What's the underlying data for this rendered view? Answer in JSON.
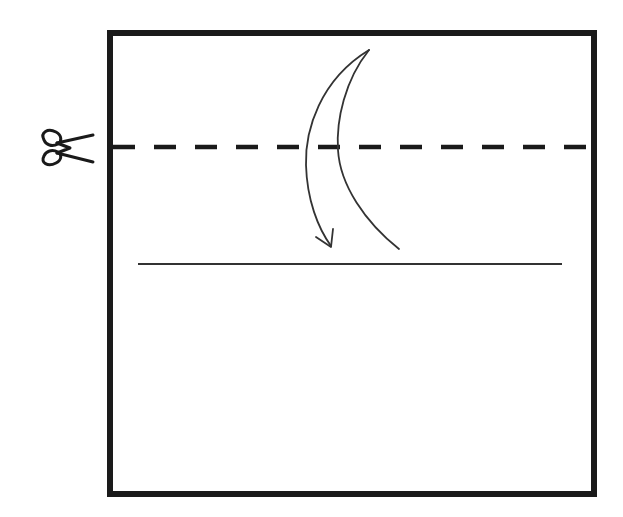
{
  "diagram": {
    "type": "origami-fold-instruction",
    "colors": {
      "background": "#ffffff",
      "stroke": "#1a1a1a",
      "thin_stroke": "#333333"
    },
    "paper": {
      "shape": "square",
      "x": 107,
      "y": 30,
      "width": 490,
      "height": 467,
      "border_width": 6
    },
    "cut_line": {
      "style": "dashed",
      "y": 147,
      "x_start": 107,
      "x_end": 597,
      "marker_icon": "scissors-icon"
    },
    "fold_line": {
      "style": "solid",
      "y": 264,
      "x_start": 138,
      "x_end": 562
    },
    "fold_arrow": {
      "direction": "down",
      "meaning": "fold top edge down to line"
    }
  }
}
